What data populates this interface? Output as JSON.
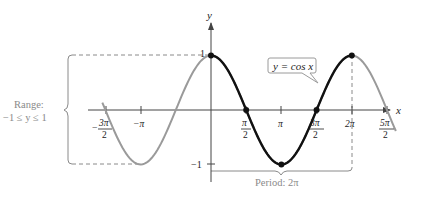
{
  "chart_data": {
    "type": "line",
    "title": "",
    "function": "y = cos x",
    "xlabel": "x",
    "ylabel": "y",
    "xlim": [
      -5.0,
      8.3
    ],
    "ylim": [
      -1.3,
      1.5
    ],
    "grid": false,
    "x_ticks": [
      {
        "value": -4.712,
        "num": "3π",
        "den": "2",
        "sign": "−"
      },
      {
        "value": -3.1416,
        "label": "−π"
      },
      {
        "value": 1.5708,
        "num": "π",
        "den": "2"
      },
      {
        "value": 3.1416,
        "label": "π"
      },
      {
        "value": 4.712,
        "num": "3π",
        "den": "2"
      },
      {
        "value": 6.2832,
        "label": "2π"
      },
      {
        "value": 7.854,
        "num": "5π",
        "den": "2"
      }
    ],
    "y_ticks": [
      {
        "value": 1,
        "label": "1"
      },
      {
        "value": -1,
        "label": "−1"
      }
    ],
    "series": [
      {
        "name": "cos x (one period, highlighted)",
        "x_range": [
          0,
          6.2832
        ],
        "color": "#111111",
        "width": 2.4
      },
      {
        "name": "cos x (extension)",
        "x_range": [
          -4.85,
          8.25
        ],
        "color": "#9a9a9a",
        "width": 2
      }
    ],
    "key_points": [
      {
        "x": 0,
        "y": 1
      },
      {
        "x": 1.5708,
        "y": 0
      },
      {
        "x": 3.1416,
        "y": -1
      },
      {
        "x": 4.712,
        "y": 0
      },
      {
        "x": 6.2832,
        "y": 1
      }
    ],
    "annotations": {
      "equation_label": "y = cos x",
      "range_label_line1": "Range:",
      "range_label_line2": "−1 ≤ y ≤ 1",
      "period_label": "Period: 2π"
    }
  },
  "labels": {
    "x_axis": "x",
    "y_axis": "y",
    "y_one": "1",
    "y_neg_one": "−1",
    "equation": "y = cos x",
    "range_title": "Range:",
    "range_value": "−1 ≤ y ≤ 1",
    "period": "Period: 2π",
    "tick_neg_pi": "−π",
    "tick_pi": "π",
    "tick_2pi": "2π",
    "tick_neg_3pi2_num": "3π",
    "tick_neg_3pi2_den": "2",
    "tick_neg_sign": "−",
    "tick_pi2_num": "π",
    "tick_pi2_den": "2",
    "tick_3pi2_num": "3π",
    "tick_3pi2_den": "2",
    "tick_5pi2_num": "5π",
    "tick_5pi2_den": "2"
  },
  "colors": {
    "highlight_curve": "#111111",
    "extension_curve": "#9a9a9a",
    "axes": "#444444",
    "annotation": "#8a8a8a"
  }
}
